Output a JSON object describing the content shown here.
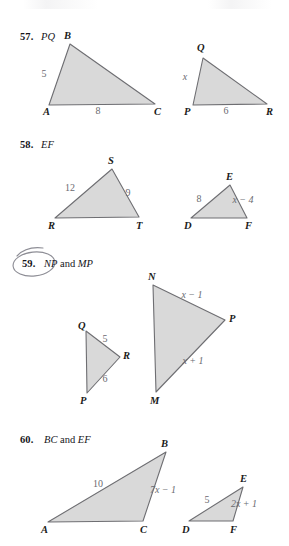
{
  "page": {
    "kind": "textbook-exercise-page",
    "ink_color": "#15151a",
    "measure_color": "#6a6a70",
    "triangle_fill": "#d9d9d9",
    "triangle_stroke": "#6e6e72",
    "annotation_color": "#8e8e96"
  },
  "problems": [
    {
      "number": "57.",
      "prompt_parts": [
        {
          "text": "PQ",
          "style": "italic"
        }
      ],
      "circled": false,
      "figures": [
        {
          "name": "triangle-abc",
          "vertices": [
            {
              "label": "A",
              "x": 49,
              "y": 105,
              "lx": 43,
              "ly": 115
            },
            {
              "label": "B",
              "x": 70,
              "y": 44,
              "lx": 64,
              "ly": 39
            },
            {
              "label": "C",
              "x": 155,
              "y": 104,
              "lx": 154,
              "ly": 115
            }
          ],
          "measures": [
            {
              "text": "5",
              "x": 44,
              "y": 77,
              "italic": false
            },
            {
              "text": "8",
              "x": 98,
              "y": 114,
              "italic": false
            }
          ]
        },
        {
          "name": "triangle-pqr",
          "vertices": [
            {
              "label": "P",
              "x": 193,
              "y": 105,
              "lx": 184,
              "ly": 115
            },
            {
              "label": "Q",
              "x": 203,
              "y": 58,
              "lx": 197,
              "ly": 51
            },
            {
              "label": "R",
              "x": 267,
              "y": 104,
              "lx": 266,
              "ly": 115
            }
          ],
          "measures": [
            {
              "text": "x",
              "x": 185,
              "y": 80,
              "italic": true
            },
            {
              "text": "6",
              "x": 226,
              "y": 114,
              "italic": false
            }
          ]
        }
      ]
    },
    {
      "number": "58.",
      "prompt_parts": [
        {
          "text": "EF",
          "style": "italic"
        }
      ],
      "circled": false,
      "figures": [
        {
          "name": "triangle-rst",
          "vertices": [
            {
              "label": "R",
              "x": 55,
              "y": 218,
              "lx": 48,
              "ly": 229
            },
            {
              "label": "S",
              "x": 112,
              "y": 169,
              "lx": 108,
              "ly": 164
            },
            {
              "label": "T",
              "x": 139,
              "y": 217,
              "lx": 136,
              "ly": 229
            }
          ],
          "measures": [
            {
              "text": "12",
              "x": 70,
              "y": 191,
              "italic": false
            },
            {
              "text": "9",
              "x": 128,
              "y": 196,
              "italic": false
            }
          ]
        },
        {
          "name": "triangle-def",
          "vertices": [
            {
              "label": "D",
              "x": 191,
              "y": 218,
              "lx": 184,
              "ly": 229
            },
            {
              "label": "E",
              "x": 230,
              "y": 185,
              "lx": 226,
              "ly": 180
            },
            {
              "label": "F",
              "x": 247,
              "y": 218,
              "lx": 245,
              "ly": 229
            }
          ],
          "measures": [
            {
              "text": "8",
              "x": 199,
              "y": 202,
              "italic": false
            },
            {
              "text": "x − 4",
              "x": 243,
              "y": 203,
              "italic": true
            }
          ]
        }
      ]
    },
    {
      "number": "59.",
      "prompt_parts": [
        {
          "text": "NP",
          "style": "italic"
        },
        {
          "text": " and ",
          "style": "roman"
        },
        {
          "text": "MP",
          "style": "italic"
        }
      ],
      "circled": true,
      "figures": [
        {
          "name": "triangle-qpr",
          "vertices": [
            {
              "label": "Q",
              "x": 86,
              "y": 331,
              "lx": 78,
              "ly": 329
            },
            {
              "label": "P",
              "x": 87,
              "y": 393,
              "lx": 80,
              "ly": 404
            },
            {
              "label": "R",
              "x": 120,
              "y": 357,
              "lx": 123,
              "ly": 359
            }
          ],
          "measures": [
            {
              "text": "5",
              "x": 105,
              "y": 342,
              "italic": false
            },
            {
              "text": "6",
              "x": 105,
              "y": 382,
              "italic": false
            }
          ]
        },
        {
          "name": "triangle-nmp",
          "vertices": [
            {
              "label": "N",
              "x": 153,
              "y": 285,
              "lx": 148,
              "ly": 280
            },
            {
              "label": "M",
              "x": 156,
              "y": 392,
              "lx": 150,
              "ly": 404
            },
            {
              "label": "P",
              "x": 225,
              "y": 320,
              "lx": 229,
              "ly": 322
            }
          ],
          "measures": [
            {
              "text": "x − 1",
              "x": 192,
              "y": 298,
              "italic": true
            },
            {
              "text": "x + 1",
              "x": 193,
              "y": 364,
              "italic": true
            }
          ]
        }
      ]
    },
    {
      "number": "60.",
      "prompt_parts": [
        {
          "text": "BC",
          "style": "italic"
        },
        {
          "text": " and ",
          "style": "roman"
        },
        {
          "text": "EF",
          "style": "italic"
        }
      ],
      "circled": false,
      "figures": [
        {
          "name": "triangle-abc-2",
          "vertices": [
            {
              "label": "A",
              "x": 48,
              "y": 522,
              "lx": 41,
              "ly": 533
            },
            {
              "label": "B",
              "x": 166,
              "y": 452,
              "lx": 161,
              "ly": 447
            },
            {
              "label": "C",
              "x": 143,
              "y": 521,
              "lx": 140,
              "ly": 533
            }
          ],
          "measures": [
            {
              "text": "10",
              "x": 98,
              "y": 487,
              "italic": false
            },
            {
              "text": "7x − 1",
              "x": 163,
              "y": 493,
              "italic": true
            }
          ]
        },
        {
          "name": "triangle-def-2",
          "vertices": [
            {
              "label": "D",
              "x": 189,
              "y": 521,
              "lx": 182,
              "ly": 533
            },
            {
              "label": "E",
              "x": 243,
              "y": 487,
              "lx": 240,
              "ly": 482
            },
            {
              "label": "F",
              "x": 233,
              "y": 521,
              "lx": 230,
              "ly": 533
            }
          ],
          "measures": [
            {
              "text": "5",
              "x": 207,
              "y": 503,
              "italic": false
            },
            {
              "text": "2x + 1",
              "x": 244,
              "y": 507,
              "italic": true
            }
          ]
        }
      ]
    }
  ],
  "headers": [
    {
      "number_x": 20,
      "number_y": 31,
      "text_x": 41,
      "text_y": 31
    },
    {
      "number_x": 20,
      "number_y": 139,
      "text_x": 41,
      "text_y": 139
    },
    {
      "number_x": 22,
      "number_y": 258,
      "text_x": 44,
      "text_y": 258
    },
    {
      "number_x": 20,
      "number_y": 434,
      "text_x": 44,
      "text_y": 434
    }
  ]
}
